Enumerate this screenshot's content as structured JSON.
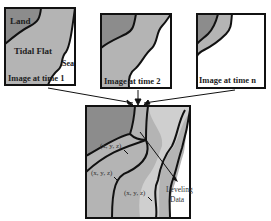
{
  "diagram": {
    "panels": [
      {
        "id": "time1",
        "caption": "Image at time 1",
        "regions": {
          "land": "Land",
          "tidal_flat": "Tidal Flat",
          "sea": "Sea"
        }
      },
      {
        "id": "time2",
        "caption": "Image at time 2"
      },
      {
        "id": "timen",
        "caption": "Image at time n"
      }
    ],
    "result_panel": {
      "point_labels": [
        "(x, y, z)",
        "(x, y, z)",
        "(x, y, z)"
      ],
      "leveling_label_line1": "Leveling",
      "leveling_label_line2": "Data"
    },
    "colors": {
      "land": "#8c8c8c",
      "tidal_flat": "#b4b4b4",
      "tidal_flat_light": "#cfcfcf",
      "sea": "#ffffff",
      "outline": "#111111"
    }
  }
}
